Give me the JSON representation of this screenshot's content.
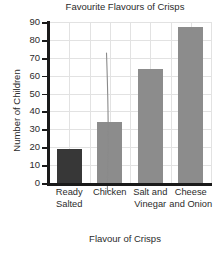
{
  "chart_data": {
    "type": "bar",
    "title": "Favourite Flavours of Crisps",
    "xlabel": "Flavour of Crisps",
    "ylabel": "Number of Children",
    "categories": [
      "Ready Salted",
      "Chicken",
      "Salt and Vinegar",
      "Cheese and Onion"
    ],
    "values": [
      19,
      34,
      64,
      87
    ],
    "ylim": [
      0,
      90
    ],
    "ytick_labels": [
      "0",
      "10",
      "20",
      "30",
      "40",
      "50",
      "60",
      "70",
      "80",
      "90"
    ],
    "ytick_values": [
      0,
      10,
      20,
      30,
      40,
      50,
      60,
      70,
      80,
      90
    ],
    "grid": true,
    "legend": "none",
    "bar_colors": [
      "#373737",
      "#8c8c8c",
      "#8c8c8c",
      "#8c8c8c"
    ],
    "annotations": [
      {
        "name": "stray-pen-line",
        "description": "thin hand-drawn vertical line from about 85 down to the top of the Ready Salted bar"
      }
    ]
  },
  "colors": {
    "bar_dark": "#373737",
    "bar_gray": "#8c8c8c",
    "axis": "#1a1a1a",
    "grid": "#e2e2e2",
    "text": "#2b2b2b",
    "background": "#ffffff",
    "artifact": "#808080"
  }
}
